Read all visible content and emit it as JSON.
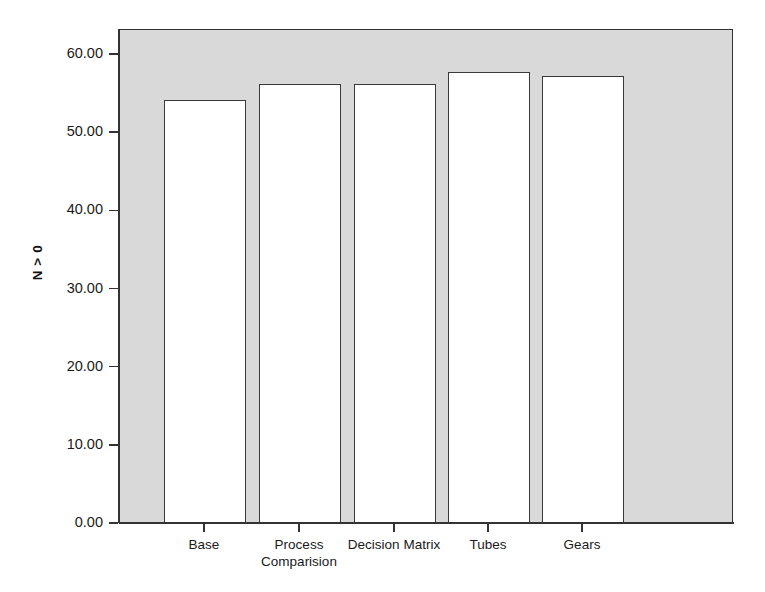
{
  "chart_data": {
    "type": "bar",
    "title": "",
    "subtitle": "",
    "xlabel": "",
    "ylabel": "N > 0",
    "categories": [
      "Base",
      "Process\nComparision",
      "Decision Matrix",
      "Tubes",
      "Gears"
    ],
    "values": [
      54,
      56,
      56,
      57.6,
      57
    ],
    "ylim": [
      0,
      63
    ],
    "yticks": [
      0,
      10,
      20,
      30,
      40,
      50,
      60
    ],
    "ytick_labels": [
      "0.00",
      "10.00",
      "20.00",
      "30.00",
      "40.00",
      "50.00",
      "60.00"
    ],
    "grid": false,
    "legend": false,
    "legend_position": "none",
    "colors": {
      "plot_background": "#d9d9d9",
      "figure_background": "#ffffff",
      "bar_fill": "#ffffff",
      "bar_edge": "#3a3a3a",
      "axis": "#333333",
      "text": "#1a1a1a"
    }
  },
  "axes": {
    "y_title": "N > 0",
    "y_tick_labels": [
      "60.00",
      "50.00",
      "40.00",
      "30.00",
      "20.00",
      "10.00",
      "0.00"
    ],
    "x_tick_labels": [
      "Base",
      "Process\nComparision",
      "Decision Matrix",
      "Tubes",
      "Gears"
    ]
  }
}
